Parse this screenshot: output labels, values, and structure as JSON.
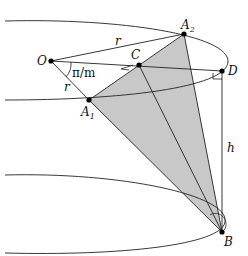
{
  "figure": {
    "colors": {
      "line": "#222222",
      "shade": "#c8c8c8",
      "point": "#000000"
    },
    "points": {
      "O": {
        "label": "O",
        "x": 51,
        "y": 61
      },
      "A1": {
        "label": "A",
        "sub": "1",
        "x": 89,
        "y": 100
      },
      "A2": {
        "label": "A",
        "sub": "2",
        "x": 184,
        "y": 34
      },
      "C": {
        "label": "C",
        "x": 139,
        "y": 65
      },
      "D": {
        "label": "D",
        "x": 222,
        "y": 71
      },
      "B": {
        "label": "B",
        "x": 222,
        "y": 232
      }
    },
    "segment_labels": {
      "r_top": "r",
      "r_left": "r",
      "h": "h",
      "angle": "π/m"
    }
  }
}
